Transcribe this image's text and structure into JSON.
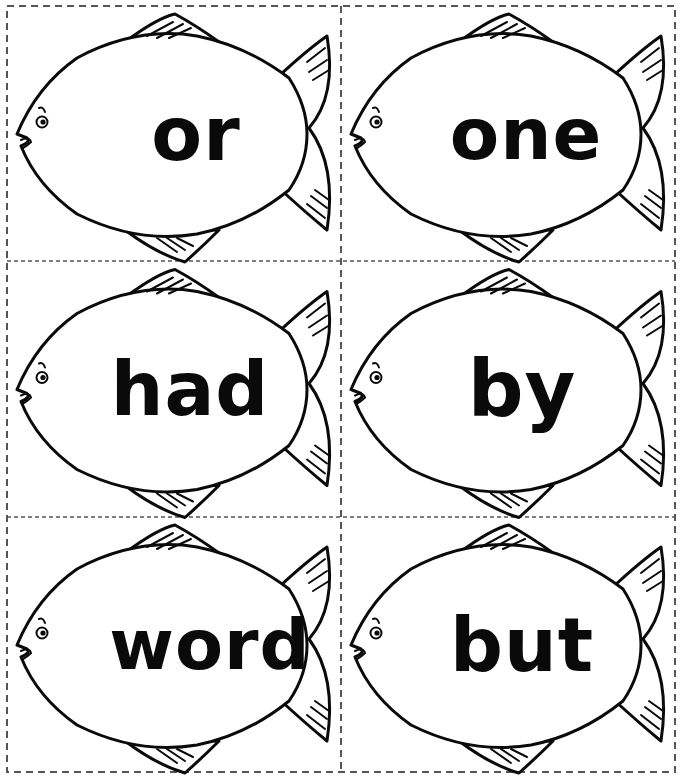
{
  "worksheet": {
    "layout": {
      "columns": 2,
      "rows": 3
    },
    "colors": {
      "ink": "#0a0a0a",
      "paper": "#ffffff",
      "cut_line": "#555555"
    },
    "cards": [
      {
        "word": "or",
        "row": 0,
        "col": 0
      },
      {
        "word": "one",
        "row": 0,
        "col": 1
      },
      {
        "word": "had",
        "row": 1,
        "col": 0
      },
      {
        "word": "by",
        "row": 1,
        "col": 1
      },
      {
        "word": "word",
        "row": 2,
        "col": 0
      },
      {
        "word": "but",
        "row": 2,
        "col": 1
      }
    ]
  }
}
